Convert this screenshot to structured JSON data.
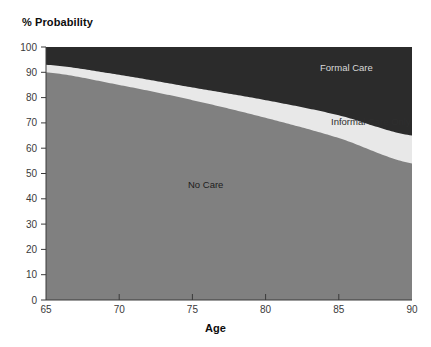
{
  "chart_data": {
    "type": "area",
    "title": "% Probability",
    "subtitle": "",
    "xlabel": "Age",
    "ylabel": "% Probability",
    "stacked": true,
    "grid": false,
    "legend_position": "inline-annotations",
    "xlim": [
      65,
      90
    ],
    "ylim": [
      0,
      100
    ],
    "xticks": [
      65,
      70,
      75,
      80,
      85,
      90
    ],
    "yticks": [
      0,
      10,
      20,
      30,
      40,
      50,
      60,
      70,
      80,
      90,
      100
    ],
    "xtick_labels": [
      "65",
      "70",
      "75",
      "80",
      "85",
      "90"
    ],
    "ytick_labels": [
      "0",
      "10",
      "20",
      "30",
      "40",
      "50",
      "60",
      "70",
      "80",
      "90",
      "100"
    ],
    "x": [
      65,
      70,
      75,
      80,
      85,
      90
    ],
    "series": [
      {
        "name": "No Care",
        "color": "#808080",
        "values": [
          90,
          85,
          79,
          72,
          64,
          54
        ]
      },
      {
        "name": "Informal Care Only",
        "color": "#e8e8e8",
        "values": [
          3,
          4,
          5,
          7,
          9,
          11
        ]
      },
      {
        "name": "Formal Care",
        "color": "#2b2b2b",
        "values": [
          7,
          11,
          16,
          21,
          27,
          35
        ]
      }
    ],
    "cumulative_boundaries": {
      "no_care_top": [
        90,
        85,
        79,
        72,
        64,
        54
      ],
      "informal_top": [
        93,
        89,
        84,
        79,
        73,
        65
      ]
    },
    "annotations": [
      {
        "text": "Formal Care",
        "series": "Formal Care"
      },
      {
        "text": "Informal Care Only",
        "series": "Informal Care Only"
      },
      {
        "text": "No Care",
        "series": "No Care"
      }
    ]
  },
  "colors": {
    "background": "#ffffff",
    "axis": "#3a3a3a",
    "text": "#0d0d0d",
    "no_care": "#808080",
    "informal_care": "#e8e8e8",
    "formal_care": "#2b2b2b",
    "formal_care_text": "#d8d8d8"
  }
}
